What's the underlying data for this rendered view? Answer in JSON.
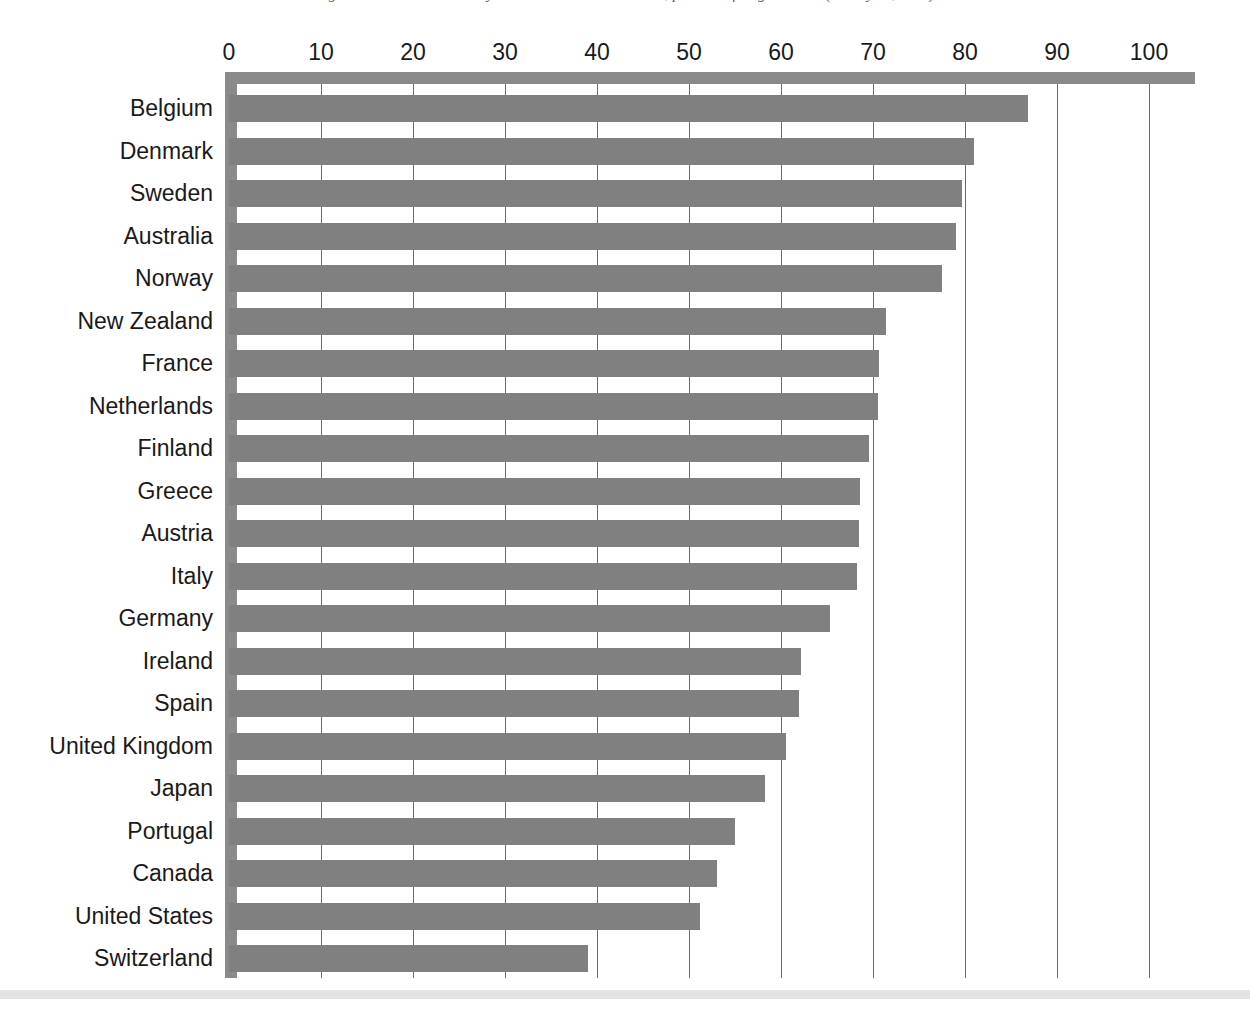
{
  "caption": {
    "text": "Figure 3. Trade union density in selected OECD countries, per cent of wage earners (latest year, 2016)"
  },
  "chart_data": {
    "type": "bar",
    "orientation": "horizontal",
    "title": "",
    "subtitle": "",
    "xlabel": "",
    "ylabel": "",
    "xlim": [
      0,
      105
    ],
    "ylim": null,
    "grid": true,
    "grid_axis": "x",
    "legend": false,
    "legend_position": "none",
    "xticks": [
      0,
      10,
      20,
      30,
      40,
      50,
      60,
      70,
      80,
      90,
      100
    ],
    "xtick_labels": [
      "0",
      "10",
      "20",
      "30",
      "40",
      "50",
      "60",
      "70",
      "80",
      "90",
      "100"
    ],
    "categories": [
      "Belgium",
      "Denmark",
      "Sweden",
      "Australia",
      "Norway",
      "New Zealand",
      "France",
      "Netherlands",
      "Finland",
      "Greece",
      "Austria",
      "Italy",
      "Germany",
      "Ireland",
      "Spain",
      "United Kingdom",
      "Japan",
      "Portugal",
      "Canada",
      "United States",
      "Switzerland"
    ],
    "values": [
      86.8,
      81.0,
      79.7,
      79.0,
      77.5,
      71.4,
      70.6,
      70.5,
      69.6,
      68.6,
      68.5,
      68.3,
      65.3,
      62.2,
      62.0,
      60.5,
      58.3,
      55.0,
      53.0,
      51.2,
      39.0
    ],
    "series": [
      {
        "name": "Coverage",
        "values": [
          86.8,
          81.0,
          79.7,
          79.0,
          77.5,
          71.4,
          70.6,
          70.5,
          69.6,
          68.6,
          68.5,
          68.3,
          65.3,
          62.2,
          62.0,
          60.5,
          58.3,
          55.0,
          53.0,
          51.2,
          39.0
        ]
      }
    ],
    "annotations": []
  },
  "style": {
    "bar_color": "#808080",
    "axis_color": "#8a8a8a",
    "grid_color": "#6b6b6b",
    "text_color": "#1a1a1a",
    "background": "#ffffff",
    "footer_rule_color": "#e3e3e3"
  }
}
